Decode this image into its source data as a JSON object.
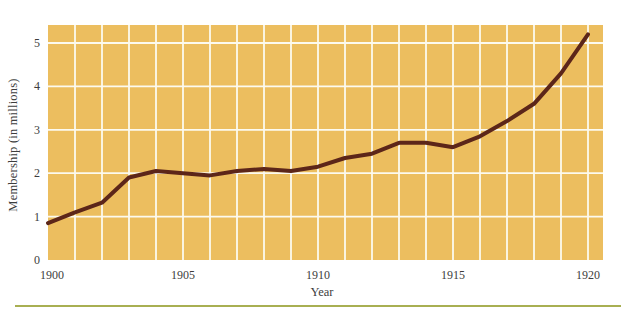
{
  "figure": {
    "kind": "scanned-textbook-line-chart"
  },
  "colors": {
    "plot_background": "#ECBE5F",
    "gridline": "#FCFAEF",
    "line": "#5C2619",
    "text": "#3D3D3D",
    "bottom_rule": "#A8AF52",
    "page_background": "#FFFFFF"
  },
  "chart_data": {
    "type": "line",
    "title": "",
    "xlabel": "Year",
    "ylabel": "Membership (in millions)",
    "x": [
      1900,
      1901,
      1902,
      1903,
      1904,
      1905,
      1906,
      1907,
      1908,
      1909,
      1910,
      1911,
      1912,
      1913,
      1914,
      1915,
      1916,
      1917,
      1918,
      1919,
      1920
    ],
    "series": [
      {
        "name": "membership",
        "values": [
          0.85,
          1.1,
          1.32,
          1.9,
          2.05,
          2.0,
          1.95,
          2.05,
          2.1,
          2.05,
          2.15,
          2.35,
          2.45,
          2.7,
          2.7,
          2.6,
          2.85,
          3.2,
          3.6,
          4.3,
          5.2
        ]
      }
    ],
    "xticks": [
      1900,
      1905,
      1910,
      1915,
      1920
    ],
    "yticks": [
      0,
      1,
      2,
      3,
      4,
      5
    ],
    "xlim": [
      1900,
      1920.55
    ],
    "ylim": [
      0,
      5.4
    ],
    "grid": true,
    "legend": false
  }
}
